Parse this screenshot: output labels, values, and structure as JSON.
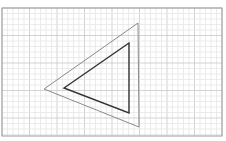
{
  "diagram": {
    "background": "#ffffff",
    "grid": {
      "x0": 2,
      "y0": 8,
      "x1": 222,
      "y1": 136,
      "minor_step": 5.5,
      "major_every": 5,
      "minor_color": "#e6e6e6",
      "major_color": "#c8c8c8",
      "border_color": "#9a9a9a"
    },
    "shapes": [
      {
        "name": "outer-triangle",
        "points": [
          [
            138,
            23
          ],
          [
            44,
            89
          ],
          [
            139,
            127
          ]
        ],
        "stroke": "#8a8a8a",
        "width": 1
      },
      {
        "name": "inner-triangle",
        "points": [
          [
            129,
            43
          ],
          [
            64,
            88
          ],
          [
            129,
            113
          ]
        ],
        "stroke": "#333333",
        "width": 1.4
      }
    ]
  }
}
